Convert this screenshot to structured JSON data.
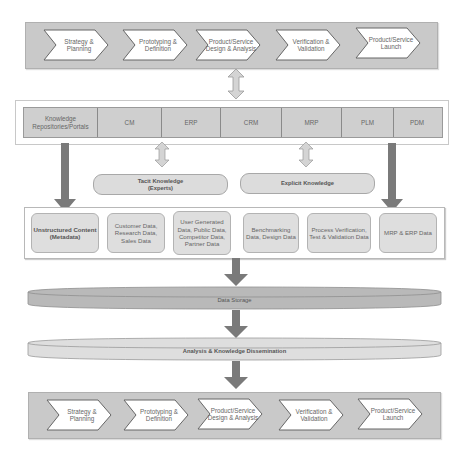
{
  "top_process": {
    "steps": [
      {
        "label": "Strategy & Planning"
      },
      {
        "label": "Prototyping & Definition"
      },
      {
        "label": "Product/Service Design & Analysis"
      },
      {
        "label": "Verification & Validation"
      },
      {
        "label": "Product/Service Launch"
      }
    ]
  },
  "repositories": {
    "cells": [
      {
        "label": "Knowledge Repositories/Portals"
      },
      {
        "label": "CM"
      },
      {
        "label": "ERP"
      },
      {
        "label": "CRM"
      },
      {
        "label": "MRP"
      },
      {
        "label": "PLM"
      },
      {
        "label": "PDM"
      }
    ]
  },
  "knowledge": {
    "tacit": "Tacit Knowledge (Experts)",
    "explicit": "Explicit Knowledge"
  },
  "data_sources": {
    "items": [
      {
        "label": "Unstructured Content (Metadata)"
      },
      {
        "label": "Customer Data, Research Data, Sales Data"
      },
      {
        "label": "User Generated Data, Public Data, Competitor Data, Partner Data"
      },
      {
        "label": "Benchmarking Data, Design Data"
      },
      {
        "label": "Process Verification, Test & Validation Data"
      },
      {
        "label": "MRP & ERP Data"
      }
    ]
  },
  "storage": {
    "data_storage": "Data Storage",
    "analysis": "Analysis & Knowledge Dissemination"
  },
  "bottom_process": {
    "steps": [
      {
        "label": "Strategy & Planning"
      },
      {
        "label": "Prototyping & Definition"
      },
      {
        "label": "Product/Service Design & Analysis"
      },
      {
        "label": "Verification & Validation"
      },
      {
        "label": "Product/Service Launch"
      }
    ]
  },
  "colors": {
    "band": "#c9c9c9",
    "chevron_fill": "#ffffff",
    "arrow_dark": "#7a7a7a",
    "arrow_light": "#d4d4d4",
    "data_storage_fill": "#b9b9b9",
    "analysis_fill": "#dedede"
  }
}
